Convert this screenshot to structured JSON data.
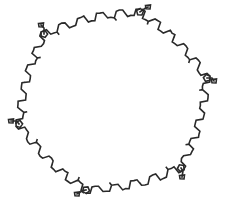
{
  "diagram": {
    "type": "molecular-structure",
    "width": 225,
    "height": 205,
    "background": "#ffffff",
    "stroke_color": "#2a2a2a",
    "stroke_width": 1.6,
    "vertices": [
      {
        "id": "top-left",
        "x": 44,
        "y": 34
      },
      {
        "id": "top-right",
        "x": 140,
        "y": 12
      },
      {
        "id": "right",
        "x": 207,
        "y": 78
      },
      {
        "id": "bottom-right",
        "x": 181,
        "y": 168
      },
      {
        "id": "bottom",
        "x": 86,
        "y": 190
      },
      {
        "id": "left",
        "x": 19,
        "y": 124
      }
    ],
    "edges": [
      {
        "from": 0,
        "to": 1,
        "zigzags": 10,
        "amplitude": 3.2
      },
      {
        "from": 1,
        "to": 2,
        "zigzags": 10,
        "amplitude": 3.2
      },
      {
        "from": 2,
        "to": 3,
        "zigzags": 10,
        "amplitude": 3.2
      },
      {
        "from": 3,
        "to": 4,
        "zigzags": 10,
        "amplitude": 3.2
      },
      {
        "from": 4,
        "to": 5,
        "zigzags": 10,
        "amplitude": 3.2
      },
      {
        "from": 5,
        "to": 0,
        "zigzags": 10,
        "amplitude": 3.2
      }
    ],
    "vertex_decorations": [
      {
        "vertex": 0,
        "dx": -3,
        "dy": -9
      },
      {
        "vertex": 1,
        "dx": 8,
        "dy": -5
      },
      {
        "vertex": 2,
        "dx": 7,
        "dy": 3
      },
      {
        "vertex": 3,
        "dx": 1,
        "dy": 9
      },
      {
        "vertex": 4,
        "dx": -9,
        "dy": 4
      },
      {
        "vertex": 5,
        "dx": -8,
        "dy": -3
      }
    ]
  }
}
